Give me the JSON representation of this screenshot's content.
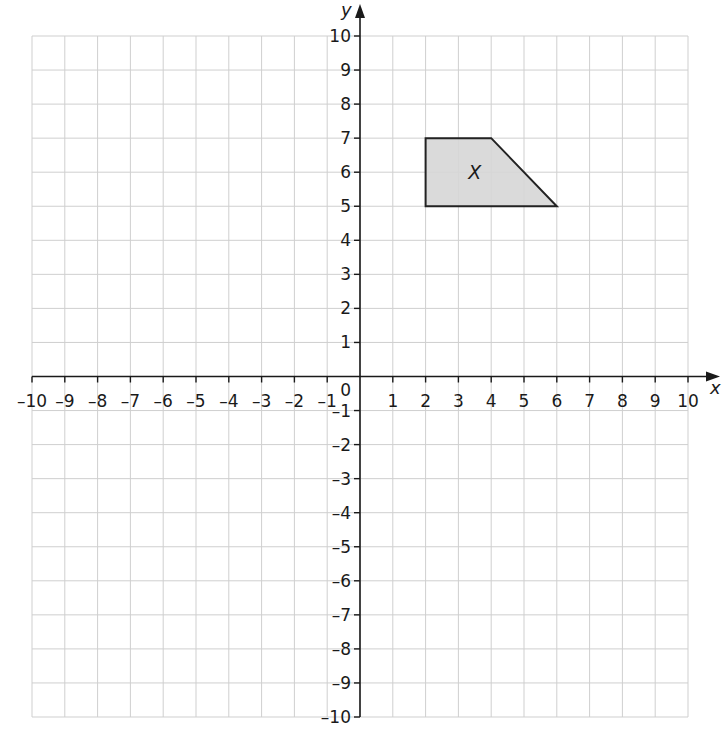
{
  "chart_data": {
    "type": "scatter",
    "title": "",
    "xlabel": "x",
    "ylabel": "y",
    "xlim": [
      -10,
      10
    ],
    "ylim": [
      -10,
      10
    ],
    "grid": true,
    "x_ticks": [
      -10,
      -9,
      -8,
      -7,
      -6,
      -5,
      -4,
      -3,
      -2,
      -1,
      1,
      2,
      3,
      4,
      5,
      6,
      7,
      8,
      9,
      10
    ],
    "y_ticks": [
      -10,
      -9,
      -8,
      -7,
      -6,
      -5,
      -4,
      -3,
      -2,
      -1,
      1,
      2,
      3,
      4,
      5,
      6,
      7,
      8,
      9,
      10
    ],
    "origin_label": "0",
    "shapes": [
      {
        "name": "X",
        "kind": "trapezium",
        "vertices": [
          [
            2,
            7
          ],
          [
            4,
            7
          ],
          [
            6,
            5
          ],
          [
            2,
            5
          ]
        ],
        "label_position": [
          3.3,
          6
        ],
        "fill": "#d6d6d6",
        "stroke": "#222222"
      }
    ]
  },
  "colors": {
    "grid": "#cfcfcf",
    "axis": "#1a1a1a",
    "background": "#ffffff"
  }
}
